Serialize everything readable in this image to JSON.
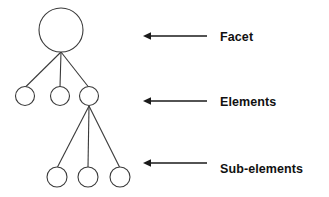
{
  "diagram": {
    "background_color": "#ffffff",
    "node_stroke_color": "#3a3a3a",
    "arrow_color": "#1a1a1a",
    "label_color": "#111111",
    "levels": [
      {
        "id": "facet",
        "label": "Facet",
        "node_count": 1,
        "nodes": [
          {
            "name": "facet-node",
            "cx": 61,
            "cy": 30,
            "r": 22
          }
        ],
        "arrow": {
          "x_start": 207,
          "x_end": 144,
          "y": 36
        },
        "label_position": {
          "x": 220,
          "y": 40
        }
      },
      {
        "id": "elements",
        "label": "Elements",
        "node_count": 3,
        "nodes": [
          {
            "name": "element-node-1",
            "cx": 25,
            "cy": 96,
            "r": 9.5
          },
          {
            "name": "element-node-2",
            "cx": 60,
            "cy": 96,
            "r": 9.5
          },
          {
            "name": "element-node-3",
            "cx": 89,
            "cy": 96,
            "r": 9.5
          }
        ],
        "arrow": {
          "x_start": 207,
          "x_end": 144,
          "y": 101
        },
        "label_position": {
          "x": 220,
          "y": 105
        }
      },
      {
        "id": "sub-elements",
        "label": "Sub-elements",
        "node_count": 3,
        "nodes": [
          {
            "name": "sub-element-node-1",
            "cx": 57,
            "cy": 177,
            "r": 10
          },
          {
            "name": "sub-element-node-2",
            "cx": 88,
            "cy": 177,
            "r": 10
          },
          {
            "name": "sub-element-node-3",
            "cx": 120,
            "cy": 177,
            "r": 10
          }
        ],
        "arrow": {
          "x_start": 207,
          "x_end": 144,
          "y": 163
        },
        "label_position": {
          "x": 220,
          "y": 172
        }
      }
    ],
    "edges": [
      {
        "name": "edge-facet-to-element-1",
        "x1": 61,
        "y1": 52,
        "x2": 25,
        "y2": 87
      },
      {
        "name": "edge-facet-to-element-2",
        "x1": 61,
        "y1": 52,
        "x2": 60,
        "y2": 87
      },
      {
        "name": "edge-facet-to-element-3",
        "x1": 61,
        "y1": 52,
        "x2": 89,
        "y2": 87
      },
      {
        "name": "edge-element-to-sub-1",
        "x1": 89,
        "y1": 106,
        "x2": 57,
        "y2": 167
      },
      {
        "name": "edge-element-to-sub-2",
        "x1": 89,
        "y1": 106,
        "x2": 88,
        "y2": 167
      },
      {
        "name": "edge-element-to-sub-3",
        "x1": 89,
        "y1": 106,
        "x2": 120,
        "y2": 167
      }
    ]
  }
}
